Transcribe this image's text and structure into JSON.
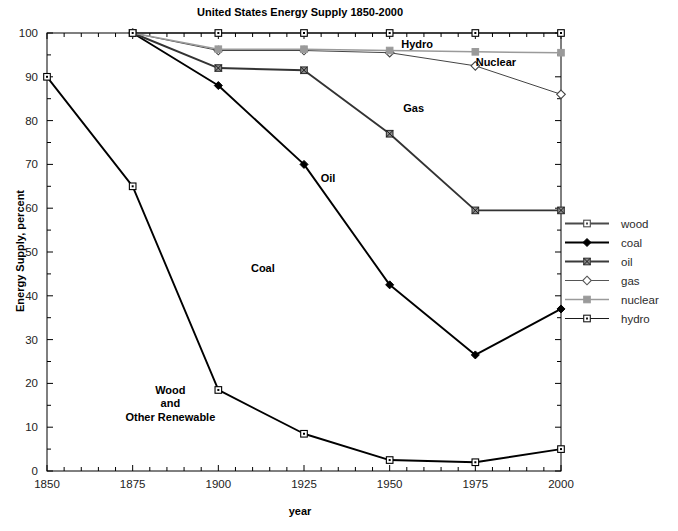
{
  "chart_data": {
    "type": "line",
    "title": "United States Energy Supply 1850-2000",
    "xlabel": "year",
    "ylabel": "Energy Supply, percent",
    "xlim": [
      1850,
      2000
    ],
    "ylim": [
      0,
      100
    ],
    "xticks": [
      1850,
      1875,
      1900,
      1925,
      1950,
      1975,
      2000
    ],
    "yticks": [
      0,
      10,
      20,
      30,
      40,
      50,
      60,
      70,
      80,
      90,
      100
    ],
    "grid": false,
    "legend_position": "right",
    "note": "Cumulative stacked-share style plot; each curve is a cumulative boundary, bands between curves are labelled Wood and Other Renewable, Coal, Oil, Gas, Nuclear, Hydro.",
    "x": [
      1850,
      1875,
      1900,
      1925,
      1950,
      1975,
      2000
    ],
    "series": [
      {
        "name": "wood",
        "marker": "open-square",
        "color": "#000000",
        "x": [
          1850,
          1875,
          1900,
          1925,
          1950,
          1975,
          2000
        ],
        "values": [
          90,
          65,
          18.5,
          8.5,
          2.5,
          2,
          5
        ]
      },
      {
        "name": "coal",
        "marker": "filled-diamond",
        "color": "#000000",
        "x": [
          1875,
          1900,
          1925,
          1950,
          1975,
          2000
        ],
        "values": [
          100,
          88,
          70,
          42.5,
          26.5,
          37
        ]
      },
      {
        "name": "oil",
        "marker": "crossed-square",
        "color": "#333333",
        "x": [
          1875,
          1900,
          1925,
          1950,
          1975,
          2000
        ],
        "values": [
          100,
          92,
          91.5,
          77,
          59.5,
          59.5
        ]
      },
      {
        "name": "gas",
        "marker": "open-diamond",
        "color": "#444444",
        "x": [
          1875,
          1900,
          1925,
          1950,
          1975,
          2000
        ],
        "values": [
          100,
          96,
          96,
          95.5,
          92.5,
          86
        ]
      },
      {
        "name": "nuclear",
        "marker": "filled-square-gray",
        "color": "#9a9a9a",
        "x": [
          1875,
          1900,
          1925,
          1950,
          1975,
          2000
        ],
        "values": [
          100,
          96.3,
          96.3,
          96,
          95.7,
          95.5
        ]
      },
      {
        "name": "hydro",
        "marker": "open-square",
        "color": "#000000",
        "x": [
          1875,
          1900,
          1925,
          1950,
          1975,
          2000
        ],
        "values": [
          100,
          100,
          100,
          100,
          100,
          100
        ]
      }
    ],
    "annotations": [
      {
        "text": "Hydro",
        "x": 1958,
        "y": 96.5
      },
      {
        "text": "Nuclear",
        "x": 1981,
        "y": 92.5
      },
      {
        "text": "Gas",
        "x": 1957,
        "y": 82
      },
      {
        "text": "Oil",
        "x": 1932,
        "y": 66
      },
      {
        "text": "Coal",
        "x": 1913,
        "y": 45.5
      },
      {
        "text": "Wood",
        "x": 1886,
        "y": 17.5
      },
      {
        "text": "and",
        "x": 1886,
        "y": 14.5
      },
      {
        "text": "Other Renewable",
        "x": 1886,
        "y": 11.5
      }
    ]
  },
  "legend": {
    "items": [
      {
        "label": "wood",
        "marker": "open-square",
        "color": "#4a4a4a"
      },
      {
        "label": "coal",
        "marker": "filled-diamond",
        "color": "#000000"
      },
      {
        "label": "oil",
        "marker": "crossed-square",
        "color": "#3a3a3a"
      },
      {
        "label": "gas",
        "marker": "open-diamond",
        "color": "#555555"
      },
      {
        "label": "nuclear",
        "marker": "filled-square-gray",
        "color": "#9a9a9a"
      },
      {
        "label": "hydro",
        "marker": "open-square",
        "color": "#1a1a1a"
      }
    ]
  }
}
